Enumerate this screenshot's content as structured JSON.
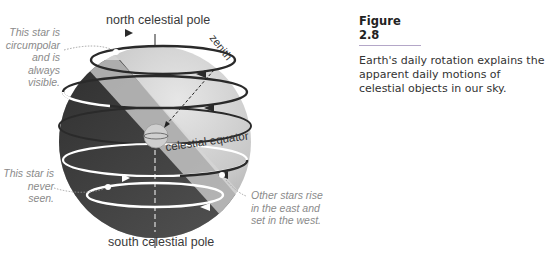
{
  "figure": {
    "title": "Figure 2.8",
    "caption": "Earth's daily rotation explains the apparent daily motions of celestial objects in our sky."
  },
  "diagram": {
    "labels": {
      "north_pole": "north celestial pole",
      "south_pole": "south celestial pole",
      "zenith": "zenith",
      "equator": "celestial equator"
    },
    "annotations": {
      "circumpolar": "This star is circumpolar and is always visible.",
      "never_seen": "This star is never seen.",
      "rise_set": "Other stars rise in the east and set in the west."
    },
    "colors": {
      "sphere_light": "#d8d8d8",
      "sphere_dark": "#3c3c3c",
      "horizon_plane": "#c9c9c9",
      "orbit_dark": "#2a2a2a",
      "orbit_light": "#ffffff",
      "caption_rule": "#b4a7c8"
    }
  }
}
